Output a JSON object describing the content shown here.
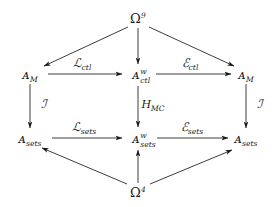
{
  "diagram": {
    "type": "commutative-diagram",
    "background_color": "#ffffff",
    "ink_color": "#1a1a1a",
    "nodes": [
      {
        "id": "omega-top",
        "label": "Ω",
        "sup": "9",
        "sub": "",
        "x": 138,
        "y": 18
      },
      {
        "id": "a-m-left",
        "label": "ᴀ",
        "sup": "",
        "sub": "M",
        "x": 30,
        "y": 74
      },
      {
        "id": "a-ctl-w",
        "label": "ᴀ",
        "sup": "w",
        "sub": "ctl",
        "x": 138,
        "y": 74
      },
      {
        "id": "a-m-right",
        "label": "ᴀ",
        "sup": "",
        "sub": "M",
        "x": 246,
        "y": 74
      },
      {
        "id": "a-sets-left",
        "label": "ᴀ",
        "sup": "",
        "sub": "sets",
        "x": 30,
        "y": 138
      },
      {
        "id": "a-sets-w",
        "label": "ᴀ",
        "sup": "w",
        "sub": "sets",
        "x": 138,
        "y": 138
      },
      {
        "id": "a-sets-right",
        "label": "ᴀ",
        "sup": "",
        "sub": "sets",
        "x": 246,
        "y": 138
      },
      {
        "id": "omega-bottom",
        "label": "Ω",
        "sup": "4",
        "sub": "",
        "x": 138,
        "y": 192
      }
    ],
    "edge_labels": [
      {
        "id": "l-ctl",
        "head": "ℒ",
        "sub": "ctl",
        "x": 82,
        "y": 63
      },
      {
        "id": "e-ctl",
        "head": "ℰ",
        "sub": "ctl",
        "x": 190,
        "y": 63
      },
      {
        "id": "h-mc",
        "head": "H",
        "sub": "MC",
        "x": 152,
        "y": 104
      },
      {
        "id": "i-left",
        "head": "ℐ",
        "sub": "",
        "x": 44,
        "y": 104
      },
      {
        "id": "i-right",
        "head": "ℐ",
        "sub": "",
        "x": 260,
        "y": 104
      },
      {
        "id": "l-sets",
        "head": "ℒ",
        "sub": "sets",
        "x": 82,
        "y": 127
      },
      {
        "id": "e-sets",
        "head": "ℰ",
        "sub": "sets",
        "x": 190,
        "y": 127
      }
    ],
    "edges": [
      {
        "id": "omega-top-to-a-m-left",
        "from": "omega-top",
        "to": "a-m-left",
        "label": ""
      },
      {
        "id": "omega-top-to-a-ctl-w",
        "from": "omega-top",
        "to": "a-ctl-w",
        "label": ""
      },
      {
        "id": "omega-top-to-a-m-right",
        "from": "omega-top",
        "to": "a-m-right",
        "label": ""
      },
      {
        "id": "a-m-left-to-a-ctl-w",
        "from": "a-m-left",
        "to": "a-ctl-w",
        "label": "l-ctl"
      },
      {
        "id": "a-ctl-w-to-a-m-right",
        "from": "a-ctl-w",
        "to": "a-m-right",
        "label": "e-ctl"
      },
      {
        "id": "a-m-left-to-a-sets-left",
        "from": "a-m-left",
        "to": "a-sets-left",
        "label": "i-left"
      },
      {
        "id": "a-ctl-w-to-a-sets-w",
        "from": "a-ctl-w",
        "to": "a-sets-w",
        "label": "h-mc"
      },
      {
        "id": "a-m-right-to-a-sets-right",
        "from": "a-m-right",
        "to": "a-sets-right",
        "label": "i-right"
      },
      {
        "id": "a-sets-left-to-a-sets-w",
        "from": "a-sets-left",
        "to": "a-sets-w",
        "label": "l-sets"
      },
      {
        "id": "a-sets-w-to-a-sets-right",
        "from": "a-sets-w",
        "to": "a-sets-right",
        "label": "e-sets"
      },
      {
        "id": "omega-bottom-to-a-sets-left",
        "from": "omega-bottom",
        "to": "a-sets-left",
        "label": ""
      },
      {
        "id": "omega-bottom-to-a-sets-w",
        "from": "omega-bottom",
        "to": "a-sets-w",
        "label": ""
      },
      {
        "id": "omega-bottom-to-a-sets-right",
        "from": "omega-bottom",
        "to": "a-sets-right",
        "label": ""
      }
    ]
  }
}
